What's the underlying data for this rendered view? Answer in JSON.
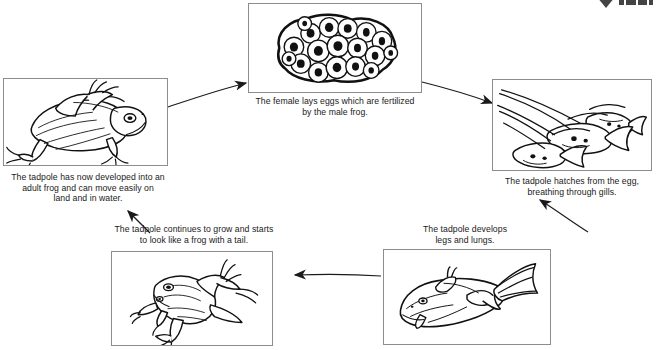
{
  "diagram": {
    "type": "cycle",
    "background_color": "#ffffff",
    "line_color": "#111111",
    "box_border_color": "#8d8d8d",
    "stages": [
      {
        "id": "eggs",
        "order": 1,
        "illustration": "frog-eggs-cluster",
        "caption": "The female lays eggs which are fertilized\nby the male frog."
      },
      {
        "id": "tadpole-gills",
        "order": 2,
        "illustration": "tadpoles-swimming",
        "caption": "The tadpole hatches from the egg,\nbreathing through gills."
      },
      {
        "id": "tadpole-legs-lungs",
        "order": 3,
        "illustration": "tadpole-with-legs",
        "caption": "The tadpole develops\nlegs and lungs."
      },
      {
        "id": "froglet",
        "order": 4,
        "illustration": "froglet-with-tail",
        "caption": "The tadpole continues to grow and starts\nto look like a frog with a tail."
      },
      {
        "id": "adult-frog",
        "order": 5,
        "illustration": "adult-frog",
        "caption": "The tadpole has now developed into an\nadult frog and can move easily on\nland and in water."
      }
    ],
    "arrows": [
      {
        "id": "arrow-adult-to-eggs",
        "from": "adult-frog",
        "to": "eggs",
        "direction": "up-right"
      },
      {
        "id": "arrow-eggs-to-tadpole",
        "from": "eggs",
        "to": "tadpole-gills",
        "direction": "down-right"
      },
      {
        "id": "arrow-tadpole-to-legs",
        "from": "tadpole-gills",
        "to": "tadpole-legs-lungs",
        "direction": "down-left"
      },
      {
        "id": "arrow-legs-to-froglet",
        "from": "tadpole-legs-lungs",
        "to": "froglet",
        "direction": "left"
      },
      {
        "id": "arrow-froglet-to-adult",
        "from": "froglet",
        "to": "adult-frog",
        "direction": "up-left"
      }
    ],
    "watermark": {
      "label": "publisher-mark",
      "visible": true
    }
  }
}
